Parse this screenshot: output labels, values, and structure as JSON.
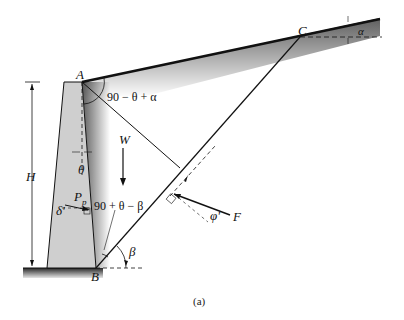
{
  "figure": {
    "caption": "(a)",
    "points": {
      "A": "A",
      "B": "B",
      "C": "C"
    },
    "labels": {
      "height": "H",
      "weight": "W",
      "passive_force": "P",
      "passive_subscript": "p",
      "wall_friction": "δ'",
      "wall_angle": "θ",
      "angle_top": "90 − θ + α",
      "angle_bottom": "90 + θ − β",
      "failure_angle": "β",
      "backfill_slope": "α",
      "soil_friction": "φ'",
      "reaction": "F"
    },
    "colors": {
      "wall_fill": "#cfcfcf",
      "line": "#111111"
    }
  }
}
